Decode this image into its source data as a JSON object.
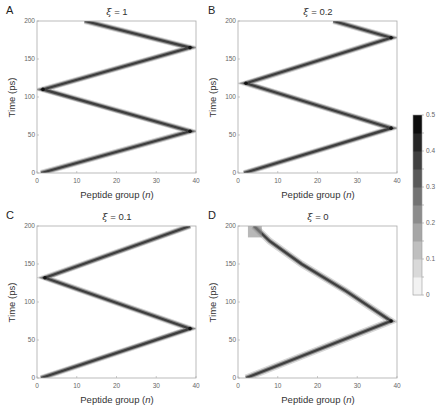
{
  "figure": {
    "panels": [
      {
        "letter": "A",
        "title_symbol": "ξ",
        "title_value": "= 1"
      },
      {
        "letter": "B",
        "title_symbol": "ξ",
        "title_value": "= 0.2"
      },
      {
        "letter": "C",
        "title_symbol": "ξ",
        "title_value": "= 0.1"
      },
      {
        "letter": "D",
        "title_symbol": "ξ",
        "title_value": "= 0"
      }
    ],
    "ylabel": "Time (ps)",
    "xlabel_text": "Peptide group (",
    "xlabel_var": "n",
    "xlabel_close": ")",
    "xticks": [
      "0",
      "10",
      "20",
      "30",
      "40"
    ],
    "yticks": [
      "0",
      "50",
      "100",
      "150",
      "200"
    ],
    "colorbar_ticks": [
      "0",
      "0.1",
      "0.2",
      "0.3",
      "0.4",
      "0.5"
    ]
  },
  "chart_data": [
    {
      "type": "heatmap",
      "title": "ξ = 1",
      "panel": "A",
      "xlabel": "Peptide group (n)",
      "ylabel": "Time (ps)",
      "xlim": [
        0,
        40
      ],
      "ylim": [
        0,
        200
      ],
      "ridge_path": [
        [
          1,
          0
        ],
        [
          38.5,
          55
        ],
        [
          1.5,
          110
        ],
        [
          38.5,
          165
        ],
        [
          12,
          200
        ]
      ],
      "colorbar": {
        "range": [
          0,
          0.5
        ],
        "ticks": [
          0,
          0.1,
          0.2,
          0.3,
          0.4,
          0.5
        ],
        "colormap": "gray_r"
      }
    },
    {
      "type": "heatmap",
      "title": "ξ = 0.2",
      "panel": "B",
      "xlabel": "Peptide group (n)",
      "ylabel": "Time (ps)",
      "xlim": [
        0,
        40
      ],
      "ylim": [
        0,
        200
      ],
      "ridge_path": [
        [
          1.5,
          0
        ],
        [
          38.5,
          59
        ],
        [
          2,
          118
        ],
        [
          38.5,
          178
        ],
        [
          24,
          200
        ]
      ],
      "colorbar": {
        "range": [
          0,
          0.5
        ],
        "ticks": [
          0,
          0.1,
          0.2,
          0.3,
          0.4,
          0.5
        ],
        "colormap": "gray_r"
      }
    },
    {
      "type": "heatmap",
      "title": "ξ = 0.1",
      "panel": "C",
      "xlabel": "Peptide group (n)",
      "ylabel": "Time (ps)",
      "xlim": [
        0,
        40
      ],
      "ylim": [
        0,
        200
      ],
      "ridge_path": [
        [
          1,
          0
        ],
        [
          38.5,
          65
        ],
        [
          2,
          132
        ],
        [
          38.5,
          200
        ]
      ],
      "colorbar": {
        "range": [
          0,
          0.5
        ],
        "ticks": [
          0,
          0.1,
          0.2,
          0.3,
          0.4,
          0.5
        ],
        "colormap": "gray_r"
      }
    },
    {
      "type": "heatmap",
      "title": "ξ = 0",
      "panel": "D",
      "xlabel": "Peptide group (n)",
      "ylabel": "Time (ps)",
      "xlim": [
        0,
        40
      ],
      "ylim": [
        0,
        200
      ],
      "ridge_path": [
        [
          2,
          0
        ],
        [
          38.5,
          75
        ],
        [
          27,
          115
        ],
        [
          16,
          150
        ],
        [
          8,
          180
        ],
        [
          4,
          200
        ]
      ],
      "note": "return path broadens and fades near top",
      "colorbar": {
        "range": [
          0,
          0.5
        ],
        "ticks": [
          0,
          0.1,
          0.2,
          0.3,
          0.4,
          0.5
        ],
        "colormap": "gray_r"
      }
    }
  ]
}
